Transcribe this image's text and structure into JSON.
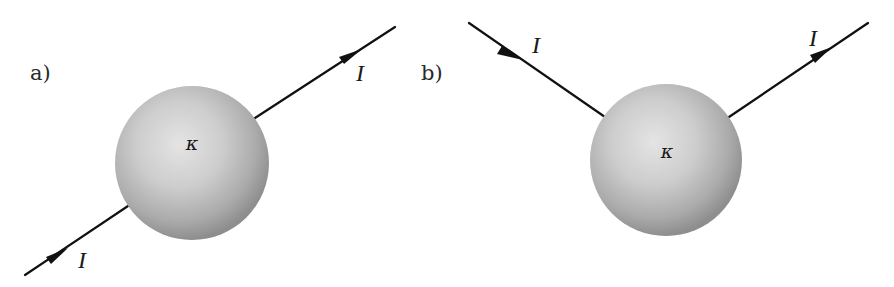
{
  "figure": {
    "panels": [
      {
        "id": "a",
        "label": "a)",
        "sphere": {
          "symbol": "κ",
          "description": "sphere with conductivity kappa"
        },
        "wires": [
          {
            "role": "incoming",
            "current_label": "I",
            "direction": "toward-sphere"
          },
          {
            "role": "outgoing",
            "current_label": "I",
            "direction": "away-from-sphere"
          }
        ],
        "configuration": "current enters and exits along a straight line through the sphere"
      },
      {
        "id": "b",
        "label": "b)",
        "sphere": {
          "symbol": "κ",
          "description": "sphere with conductivity kappa"
        },
        "wires": [
          {
            "role": "incoming",
            "current_label": "I",
            "direction": "toward-sphere"
          },
          {
            "role": "outgoing",
            "current_label": "I",
            "direction": "away-from-sphere"
          }
        ],
        "configuration": "current enters and exits at points on the upper hemisphere (V-shaped)"
      }
    ],
    "colors": {
      "sphere_light": "#e6e6e6",
      "sphere_mid": "#b8b8b8",
      "sphere_dark": "#8c8c8c",
      "wire": "#111111"
    }
  }
}
